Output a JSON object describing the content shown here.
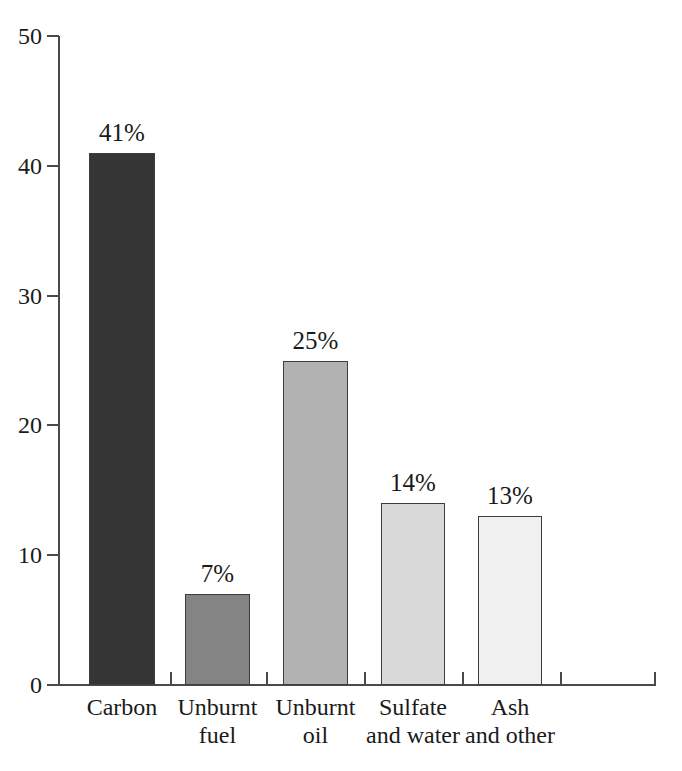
{
  "chart_data": {
    "type": "bar",
    "title": "",
    "subtitle": "",
    "xlabel": "",
    "ylabel": "",
    "ylim": [
      0,
      50
    ],
    "ytick_values": [
      0,
      10,
      20,
      30,
      40,
      50
    ],
    "ytick_labels": [
      "0",
      "10",
      "20",
      "30",
      "40",
      "50"
    ],
    "grid": false,
    "legend": false,
    "categories": [
      "Carbon",
      "Unburnt fuel",
      "Unburnt oil",
      "Sulfate and water",
      "Ash and other"
    ],
    "category_lines": [
      [
        "Carbon",
        ""
      ],
      [
        "Unburnt",
        "fuel"
      ],
      [
        "Unburnt",
        "oil"
      ],
      [
        "Sulfate",
        "and water"
      ],
      [
        "Ash",
        "and other"
      ]
    ],
    "values": [
      41,
      7,
      25,
      14,
      13
    ],
    "data_labels": [
      "41%",
      "7%",
      "25%",
      "14%",
      "13%"
    ],
    "bar_colors": [
      "#353535",
      "#848484",
      "#b2b2b2",
      "#d9d9d9",
      "#f0f0f0"
    ],
    "bar_edge_color": "#3d3d3d",
    "axis_color": "#4a4a4a",
    "background_color": "#ffffff",
    "text_color": "#1a1a1a"
  },
  "axis": {
    "y_ticks": [
      {
        "label": "50",
        "value": 50
      },
      {
        "label": "40",
        "value": 40
      },
      {
        "label": "30",
        "value": 30
      },
      {
        "label": "20",
        "value": 20
      },
      {
        "label": "10",
        "value": 10
      },
      {
        "label": "0",
        "value": 0
      }
    ]
  }
}
